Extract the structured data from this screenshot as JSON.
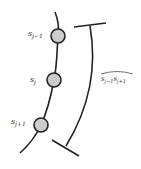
{
  "diagram": {
    "nodes": [
      {
        "id": "s_j-1",
        "label_base": "s",
        "label_sub": "j−1",
        "cx": 58,
        "cy": 36
      },
      {
        "id": "s_j",
        "label_base": "s",
        "label_sub": "j",
        "cx": 54,
        "cy": 80
      },
      {
        "id": "s_j+1",
        "label_base": "s",
        "label_sub": "j+1",
        "cx": 41,
        "cy": 125
      }
    ],
    "arc_label": {
      "base1": "s",
      "sub1": "j−1",
      "base2": "s",
      "sub2": "j+1"
    },
    "colors": {
      "stroke": "#222222",
      "node_fill": "#cccccc",
      "text": "#333333"
    }
  }
}
